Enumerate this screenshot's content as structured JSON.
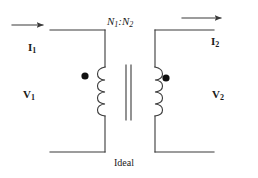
{
  "diagram": {
    "stroke_color": "#3a3a3a",
    "text_color": "#1a1a1a",
    "background_color": "#ffffff",
    "labels": {
      "current_primary": {
        "symbol": "I",
        "subscript": "1",
        "full": "I1"
      },
      "current_secondary": {
        "symbol": "I",
        "subscript": "2",
        "full": "I2"
      },
      "voltage_primary": {
        "symbol": "V",
        "subscript": "1",
        "full": "V1"
      },
      "voltage_secondary": {
        "symbol": "V",
        "subscript": "2",
        "full": "V2"
      },
      "turns_ratio": {
        "n_symbol": "N",
        "primary_sub": "1",
        "separator": ":",
        "secondary_sub": "2",
        "full": "N1:N2"
      },
      "core_label": "Ideal"
    },
    "elements": {
      "primary_coil_turns": 4,
      "secondary_coil_turns": 4,
      "core_lines": 2,
      "polarity_dots": 2,
      "current_arrows": 2
    }
  }
}
